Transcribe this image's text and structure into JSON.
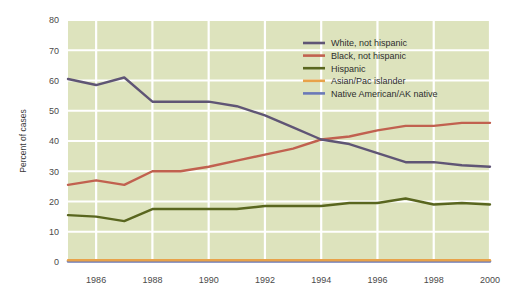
{
  "chart_data": {
    "type": "line",
    "title": "",
    "xlabel": "",
    "ylabel": "Percent of cases",
    "xlim": [
      1985,
      2000
    ],
    "ylim": [
      0,
      80
    ],
    "grid": true,
    "legend_position": "top-right",
    "x": [
      1985,
      1986,
      1987,
      1988,
      1989,
      1990,
      1991,
      1992,
      1993,
      1994,
      1995,
      1996,
      1997,
      1998,
      1999,
      2000
    ],
    "xticks": [
      1986,
      1988,
      1990,
      1992,
      1994,
      1996,
      1998,
      2000
    ],
    "xtick_labels": [
      "1986",
      "1988",
      "1990",
      "1992",
      "1994",
      "1996",
      "1998",
      "2000"
    ],
    "yticks": [
      0,
      10,
      20,
      30,
      40,
      50,
      60,
      70,
      80
    ],
    "ytick_labels": [
      "0",
      "10",
      "20",
      "30",
      "40",
      "50",
      "60",
      "70",
      "80"
    ],
    "series": [
      {
        "name": "White, not hispanic",
        "color": "#5f5575",
        "values": [
          60.5,
          58.5,
          61.0,
          53.0,
          53.0,
          53.0,
          51.5,
          48.5,
          44.5,
          40.5,
          39.0,
          36.0,
          33.0,
          33.0,
          32.0,
          31.5
        ]
      },
      {
        "name": "Black, not hispanic",
        "color": "#c1614f",
        "values": [
          25.5,
          27.0,
          25.5,
          30.0,
          30.0,
          31.5,
          33.5,
          35.5,
          37.5,
          40.5,
          41.5,
          43.5,
          45.0,
          45.0,
          46.0,
          46.0
        ]
      },
      {
        "name": "Hispanic",
        "color": "#59661f",
        "values": [
          15.5,
          15.0,
          13.5,
          17.5,
          17.5,
          17.5,
          17.5,
          18.5,
          18.5,
          18.5,
          19.5,
          19.5,
          21.0,
          19.0,
          19.5,
          19.0
        ]
      },
      {
        "name": "Asian/Pac islander",
        "color": "#e8a24a",
        "values": [
          0.6,
          0.6,
          0.6,
          0.6,
          0.6,
          0.6,
          0.6,
          0.6,
          0.6,
          0.6,
          0.6,
          0.6,
          0.6,
          0.6,
          0.6,
          0.6
        ]
      },
      {
        "name": "Native American/AK native",
        "color": "#6a79b8",
        "values": [
          0.15,
          0.15,
          0.15,
          0.15,
          0.15,
          0.15,
          0.15,
          0.15,
          0.15,
          0.15,
          0.15,
          0.15,
          0.15,
          0.15,
          0.15,
          0.15
        ]
      }
    ],
    "colors": {
      "plot_background": "#dde3bd",
      "grid": "#ffffff",
      "page_background": "#ffffff"
    }
  }
}
